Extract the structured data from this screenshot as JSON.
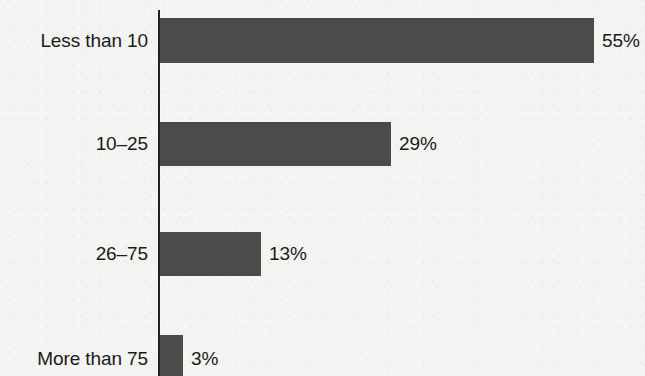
{
  "chart_data": {
    "type": "bar",
    "orientation": "horizontal",
    "title": "",
    "subtitle": "",
    "xlabel": "",
    "ylabel": "",
    "grid": false,
    "legend": null,
    "xlim": [
      0,
      55
    ],
    "value_suffix": "%",
    "categories": [
      "Less than 10",
      "10–25",
      "26–75",
      "More than 75"
    ],
    "values": [
      55,
      29,
      13,
      3
    ],
    "value_labels": [
      "55%",
      "29%",
      "13%",
      "3%"
    ],
    "bars": [
      {
        "category": "Less than 10",
        "value": 55,
        "value_label": "55%",
        "bar_left": 160,
        "bar_width": 434,
        "bar_top": 18,
        "bar_height": 45,
        "label_top": 31,
        "value_left": 602
      },
      {
        "category": "10–25",
        "value": 29,
        "value_label": "29%",
        "bar_left": 160,
        "bar_width": 231,
        "bar_top": 122,
        "bar_height": 44,
        "label_top": 134,
        "value_left": 399
      },
      {
        "category": "26–75",
        "value": 13,
        "value_label": "13%",
        "bar_left": 160,
        "bar_width": 101,
        "bar_top": 232,
        "bar_height": 44,
        "label_top": 244,
        "value_left": 269
      },
      {
        "category": "More than 75",
        "value": 3,
        "value_label": "3%",
        "bar_left": 160,
        "bar_width": 23,
        "bar_top": 335,
        "bar_height": 41,
        "label_top": 349,
        "value_left": 191
      }
    ]
  },
  "colors": {
    "bar_fill": "#4d4b4a",
    "axis_line": "#23211f",
    "text": "#1c1a18",
    "background": "#f4f4f2"
  }
}
